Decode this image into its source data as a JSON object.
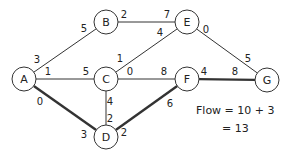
{
  "nodes": [
    {
      "id": "A",
      "label": "A",
      "x": 24,
      "y": 79
    },
    {
      "id": "B",
      "label": "B",
      "x": 106,
      "y": 22
    },
    {
      "id": "C",
      "label": "C",
      "x": 106,
      "y": 79
    },
    {
      "id": "D",
      "label": "D",
      "x": 106,
      "y": 137
    },
    {
      "id": "E",
      "label": "E",
      "x": 187,
      "y": 22
    },
    {
      "id": "F",
      "label": "F",
      "x": 187,
      "y": 79
    },
    {
      "id": "G",
      "label": "G",
      "x": 267,
      "y": 80
    }
  ],
  "edges": [
    {
      "from": "A",
      "to": "B",
      "label_from": "3",
      "label_to": "5",
      "bold": false,
      "lf": {
        "x": 37,
        "y": 63
      },
      "lt": {
        "x": 84,
        "y": 32
      }
    },
    {
      "from": "A",
      "to": "C",
      "label_from": "1",
      "label_to": "5",
      "bold": false,
      "lf": {
        "x": 48,
        "y": 75
      },
      "lt": {
        "x": 86,
        "y": 75
      }
    },
    {
      "from": "A",
      "to": "D",
      "label_from": "0",
      "label_to": "3",
      "bold": true,
      "lf": {
        "x": 40,
        "y": 105
      },
      "lt": {
        "x": 84,
        "y": 138
      }
    },
    {
      "from": "B",
      "to": "E",
      "label_from": "2",
      "label_to": "7",
      "bold": false,
      "lf": {
        "x": 124,
        "y": 18
      },
      "lt": {
        "x": 167,
        "y": 18
      }
    },
    {
      "from": "C",
      "to": "E",
      "label_from": "1",
      "label_to": "4",
      "bold": false,
      "lf": {
        "x": 120,
        "y": 62
      },
      "lt": {
        "x": 160,
        "y": 36
      }
    },
    {
      "from": "C",
      "to": "F",
      "label_from": "0",
      "label_to": "8",
      "bold": false,
      "lf": {
        "x": 130,
        "y": 75
      },
      "lt": {
        "x": 164,
        "y": 75
      }
    },
    {
      "from": "C",
      "to": "D",
      "label_from": "4",
      "label_to": "2",
      "bold": false,
      "lf": {
        "x": 110,
        "y": 105
      },
      "lt": {
        "x": 110,
        "y": 122
      }
    },
    {
      "from": "D",
      "to": "F",
      "label_from": "2",
      "label_to": "6",
      "bold": true,
      "lf": {
        "x": 124,
        "y": 136
      },
      "lt": {
        "x": 170,
        "y": 107
      }
    },
    {
      "from": "E",
      "to": "G",
      "label_from": "0",
      "label_to": "5",
      "bold": false,
      "lf": {
        "x": 206,
        "y": 33
      },
      "lt": {
        "x": 248,
        "y": 62
      }
    },
    {
      "from": "F",
      "to": "G",
      "label_from": "4",
      "label_to": "8",
      "bold": true,
      "lf": {
        "x": 204,
        "y": 75
      },
      "lt": {
        "x": 235,
        "y": 75
      }
    }
  ],
  "flow": {
    "line1": "Flow = 10 + 3",
    "line2": "= 13"
  },
  "node_radius": 12,
  "colors": {
    "stroke": "#333333",
    "fill": "#ffffff"
  }
}
